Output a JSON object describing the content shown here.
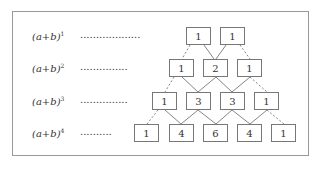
{
  "diagram": {
    "rows": [
      {
        "label_base": "(a+b)",
        "exponent": "1",
        "dots": "...................",
        "values": [
          "1",
          "1"
        ]
      },
      {
        "label_base": "(a+b)",
        "exponent": "2",
        "dots": "...............",
        "values": [
          "1",
          "2",
          "1"
        ]
      },
      {
        "label_base": "(a+b)",
        "exponent": "3",
        "dots": "...............",
        "values": [
          "1",
          "3",
          "3",
          "1"
        ]
      },
      {
        "label_base": "(a+b)",
        "exponent": "4",
        "dots": "..........",
        "values": [
          "1",
          "4",
          "6",
          "4",
          "1"
        ]
      }
    ]
  }
}
